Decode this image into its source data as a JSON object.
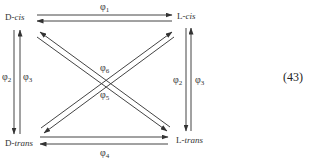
{
  "diagram": {
    "nodes": {
      "d_cis": {
        "prefix": "D-",
        "suffix": "cis"
      },
      "l_cis": {
        "prefix": "L-",
        "suffix": "cis"
      },
      "d_trans": {
        "prefix": "D-",
        "suffix": "trans"
      },
      "l_trans": {
        "prefix": "L-",
        "suffix": "trans"
      }
    },
    "rates": {
      "phi1": {
        "sym": "φ",
        "sub": "1"
      },
      "phi2_left": {
        "sym": "φ",
        "sub": "2"
      },
      "phi3_left": {
        "sym": "φ",
        "sub": "3"
      },
      "phi2_right": {
        "sym": "φ",
        "sub": "2"
      },
      "phi3_right": {
        "sym": "φ",
        "sub": "3"
      },
      "phi4": {
        "sym": "φ",
        "sub": "4"
      },
      "phi5": {
        "sym": "φ",
        "sub": "5"
      },
      "phi6": {
        "sym": "φ",
        "sub": "6"
      }
    },
    "edges": [
      {
        "from": "D-cis",
        "to": "L-cis",
        "rate": "φ1"
      },
      {
        "from": "L-cis",
        "to": "D-cis",
        "rate": "φ1"
      },
      {
        "from": "D-cis",
        "to": "D-trans",
        "rate": "φ2"
      },
      {
        "from": "D-trans",
        "to": "D-cis",
        "rate": "φ3"
      },
      {
        "from": "L-cis",
        "to": "L-trans",
        "rate": "φ2"
      },
      {
        "from": "L-trans",
        "to": "L-cis",
        "rate": "φ3"
      },
      {
        "from": "D-trans",
        "to": "L-trans",
        "rate": "φ4"
      },
      {
        "from": "L-trans",
        "to": "D-trans",
        "rate": "φ4"
      },
      {
        "from": "D-cis",
        "to": "L-trans",
        "rate": "φ5/φ6"
      },
      {
        "from": "L-trans",
        "to": "D-cis",
        "rate": "φ5/φ6"
      },
      {
        "from": "D-trans",
        "to": "L-cis",
        "rate": "φ5/φ6"
      },
      {
        "from": "L-cis",
        "to": "D-trans",
        "rate": "φ5/φ6"
      }
    ],
    "equation_number": "(43)"
  }
}
